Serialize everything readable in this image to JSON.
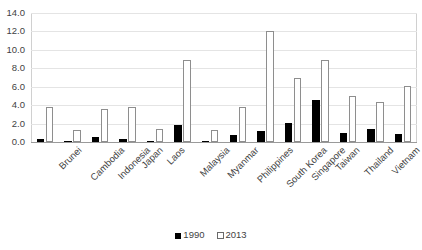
{
  "chart_data": {
    "type": "bar",
    "title": "",
    "xlabel": "",
    "ylabel": "",
    "ylim": [
      0.0,
      14.0
    ],
    "ytick_labels": [
      "14.0",
      "12.0",
      "10.0",
      "8.0",
      "6.0",
      "4.0",
      "2.0",
      "0.0"
    ],
    "ytick_values": [
      14.0,
      12.0,
      10.0,
      8.0,
      6.0,
      4.0,
      2.0,
      0.0
    ],
    "grid": true,
    "legend_position": "bottom",
    "categories": [
      "Brunei",
      "Cambodia",
      "Indonesia",
      "Japan",
      "Laos",
      "Malaysia",
      "Myanmar",
      "Philippines",
      "South Korea",
      "Singapore",
      "Taiwan",
      "Thailand",
      "Vietnam",
      "ASEAN + JKT"
    ],
    "series": [
      {
        "name": "1990",
        "color": "#000000",
        "values": [
          0.3,
          0.05,
          0.5,
          0.35,
          0.15,
          1.8,
          0.15,
          0.75,
          1.2,
          2.1,
          4.6,
          0.95,
          1.45,
          0.85
        ]
      },
      {
        "name": "2013",
        "color": "#ffffff",
        "values": [
          3.8,
          1.3,
          3.6,
          3.85,
          1.4,
          8.9,
          1.3,
          3.8,
          12.1,
          7.0,
          8.9,
          5.0,
          4.3,
          6.1
        ]
      }
    ]
  },
  "legend": {
    "items": [
      {
        "label": "1990"
      },
      {
        "label": "2013"
      }
    ]
  }
}
